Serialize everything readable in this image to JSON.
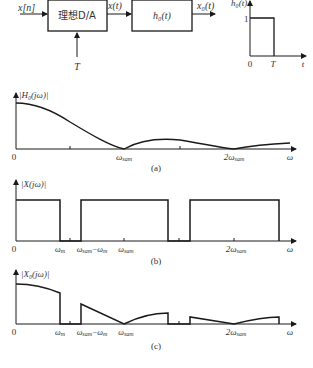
{
  "block_diagram": {
    "input_label": "x[n]",
    "block1_label": "理想D/A",
    "mid_label": "x(t)",
    "block2_label": "h₀(t)",
    "output_label": "x₀(t)",
    "control_label": "T"
  },
  "impulse_response": {
    "y_label": "h₀(t)",
    "height_label": "1",
    "x_origin": "0",
    "x_end": "T",
    "x_axis": "t"
  },
  "plots": [
    {
      "id": "a",
      "y_label": "|H₀(jω)|",
      "origin": "0",
      "tick_labels": [
        "ω_sam",
        "2ω_sam"
      ],
      "tick_display": [
        "ωsam",
        "2ωsam"
      ],
      "x_axis": "ω",
      "caption": "(a)"
    },
    {
      "id": "b",
      "y_label": "|X(jω)|",
      "origin": "0",
      "tick_labels": [
        "ω_m",
        "ω_sam−ω_m",
        "ω_sam",
        "2ω_sam"
      ],
      "x_axis": "ω",
      "caption": "(b)"
    },
    {
      "id": "c",
      "y_label": "|X₀(jω)|",
      "origin": "0",
      "tick_labels": [
        "ω_m",
        "ω_sam−ω_m",
        "ω_sam",
        "2ω_sam"
      ],
      "x_axis": "ω",
      "caption": "(c)"
    }
  ]
}
